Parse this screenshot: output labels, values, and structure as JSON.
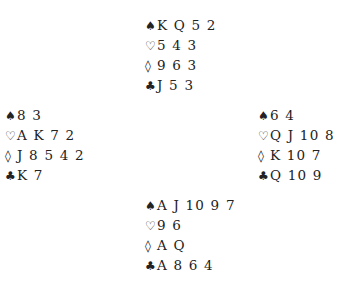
{
  "deal": {
    "north": {
      "spades": "K Q 5 2",
      "hearts": "5 4 3",
      "diamonds": "9 6 3",
      "clubs": "J 5 3"
    },
    "west": {
      "spades": "8 3",
      "hearts": "A K 7 2",
      "diamonds": "J 8 5 4 2",
      "clubs": "K 7"
    },
    "east": {
      "spades": "6 4",
      "hearts": "Q J 10 8",
      "diamonds": "K 10 7",
      "clubs": "Q 10 9"
    },
    "south": {
      "spades": "A J 10 9 7",
      "hearts": "9 6",
      "diamonds": "A Q",
      "clubs": "A 8 6 4"
    }
  },
  "suits": {
    "spades": "♠",
    "hearts": "♡",
    "diamonds": "◊",
    "clubs": "♣"
  }
}
